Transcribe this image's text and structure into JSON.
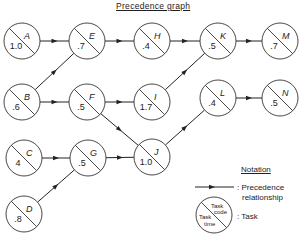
{
  "title": "Precedence graph",
  "nodes": [
    {
      "code": "A",
      "time": "1.0",
      "x": 22,
      "y": 41
    },
    {
      "code": "B",
      "time": ".6",
      "x": 22,
      "y": 102
    },
    {
      "code": "C",
      "time": "4",
      "x": 24,
      "y": 158
    },
    {
      "code": "D",
      "time": ".8",
      "x": 24,
      "y": 214
    },
    {
      "code": "E",
      "time": ".7",
      "x": 87,
      "y": 41
    },
    {
      "code": "F",
      "time": ".5",
      "x": 87,
      "y": 102
    },
    {
      "code": "G",
      "time": ".5",
      "x": 88,
      "y": 158
    },
    {
      "code": "H",
      "time": ".4",
      "x": 152,
      "y": 41
    },
    {
      "code": "I",
      "time": "1.7",
      "x": 152,
      "y": 102
    },
    {
      "code": "J",
      "time": "1.0",
      "x": 152,
      "y": 157
    },
    {
      "code": "K",
      "time": ".5",
      "x": 218,
      "y": 41
    },
    {
      "code": "L",
      "time": ".4",
      "x": 218,
      "y": 98
    },
    {
      "code": "M",
      "time": ".7",
      "x": 280,
      "y": 41
    },
    {
      "code": "N",
      "time": ".5",
      "x": 280,
      "y": 98
    }
  ],
  "edges": [
    [
      "A",
      "E"
    ],
    [
      "B",
      "E"
    ],
    [
      "B",
      "F"
    ],
    [
      "E",
      "H"
    ],
    [
      "H",
      "K"
    ],
    [
      "K",
      "M"
    ],
    [
      "F",
      "I"
    ],
    [
      "F",
      "J"
    ],
    [
      "I",
      "K"
    ],
    [
      "C",
      "G"
    ],
    [
      "D",
      "G"
    ],
    [
      "G",
      "J"
    ],
    [
      "J",
      "L"
    ],
    [
      "L",
      "N"
    ]
  ],
  "legend": {
    "title": "Notation",
    "precedence_label": ": Precedence",
    "precedence_label2": "relationship",
    "task_label": ": Task",
    "task_code_label": "Task code",
    "task_time_label": "Task time"
  }
}
